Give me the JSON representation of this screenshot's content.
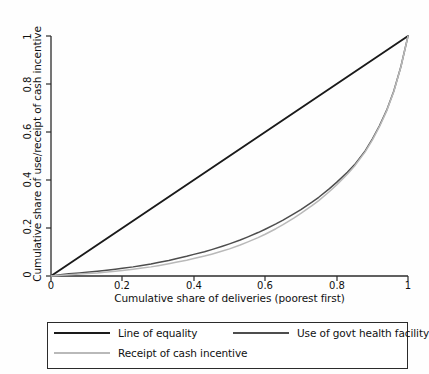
{
  "chart_data": {
    "type": "line",
    "title": "",
    "xlabel": "Cumulative share of deliveries (poorest first)",
    "ylabel": "Cumulative share of use/receipt of cash incentive",
    "xlim": [
      0,
      1
    ],
    "ylim": [
      0,
      1
    ],
    "grid": false,
    "legend_position": "below-plot",
    "xticks": [
      "0",
      "0.2",
      "0.4",
      "0.6",
      "0.8",
      "1"
    ],
    "xtick_values": [
      0,
      0.2,
      0.4,
      0.6,
      0.8,
      1
    ],
    "yticks": [
      "0",
      "0.2",
      "0.4",
      "0.6",
      "0.8",
      "1"
    ],
    "ytick_values": [
      0,
      0.2,
      0.4,
      0.6,
      0.8,
      1
    ],
    "series": [
      {
        "name": "Line of equality",
        "color": "#1a1a1a",
        "width": 1.9,
        "x": [
          0,
          1
        ],
        "values": [
          0,
          1
        ]
      },
      {
        "name": "Use of govt health facility",
        "color": "#4d4d4d",
        "width": 1.5,
        "x": [
          0,
          0.02,
          0.05,
          0.08,
          0.1,
          0.13,
          0.15,
          0.18,
          0.2,
          0.23,
          0.25,
          0.28,
          0.3,
          0.33,
          0.35,
          0.38,
          0.4,
          0.43,
          0.45,
          0.48,
          0.5,
          0.53,
          0.55,
          0.58,
          0.6,
          0.63,
          0.65,
          0.68,
          0.7,
          0.73,
          0.75,
          0.78,
          0.8,
          0.83,
          0.85,
          0.88,
          0.9,
          0.92,
          0.94,
          0.96,
          0.98,
          1
        ],
        "values": [
          0,
          0.004,
          0.009,
          0.013,
          0.016,
          0.02,
          0.023,
          0.028,
          0.032,
          0.038,
          0.043,
          0.05,
          0.056,
          0.065,
          0.072,
          0.082,
          0.09,
          0.101,
          0.11,
          0.124,
          0.134,
          0.15,
          0.162,
          0.181,
          0.195,
          0.217,
          0.233,
          0.259,
          0.277,
          0.307,
          0.328,
          0.364,
          0.39,
          0.432,
          0.463,
          0.521,
          0.57,
          0.626,
          0.69,
          0.77,
          0.872,
          1
        ]
      },
      {
        "name": "Receipt of cash incentive",
        "color": "#b9b9b9",
        "width": 1.5,
        "x": [
          0,
          0.02,
          0.05,
          0.08,
          0.1,
          0.13,
          0.15,
          0.18,
          0.2,
          0.23,
          0.25,
          0.28,
          0.3,
          0.33,
          0.35,
          0.38,
          0.4,
          0.43,
          0.45,
          0.48,
          0.5,
          0.53,
          0.55,
          0.58,
          0.6,
          0.63,
          0.65,
          0.68,
          0.7,
          0.73,
          0.75,
          0.78,
          0.8,
          0.83,
          0.85,
          0.88,
          0.9,
          0.92,
          0.94,
          0.96,
          0.98,
          1
        ],
        "values": [
          0,
          0.002,
          0.005,
          0.008,
          0.01,
          0.013,
          0.016,
          0.02,
          0.023,
          0.028,
          0.032,
          0.038,
          0.043,
          0.051,
          0.057,
          0.066,
          0.073,
          0.083,
          0.091,
          0.104,
          0.113,
          0.129,
          0.141,
          0.16,
          0.174,
          0.197,
          0.214,
          0.241,
          0.261,
          0.292,
          0.314,
          0.352,
          0.379,
          0.424,
          0.457,
          0.517,
          0.566,
          0.622,
          0.687,
          0.768,
          0.871,
          1
        ]
      }
    ]
  },
  "legend": {
    "items": [
      {
        "label": "Line of equality"
      },
      {
        "label": "Use of govt health facility"
      },
      {
        "label": "Receipt of cash incentive"
      }
    ]
  }
}
